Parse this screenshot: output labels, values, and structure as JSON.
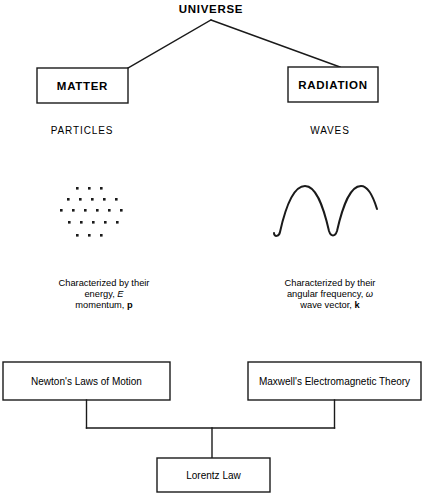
{
  "diagram": {
    "title": "UNIVERSE",
    "branches": [
      {
        "id": "matter",
        "box_label": "MATTER",
        "subtitle": "PARTICLES",
        "graphic": "particles-dot-cloud",
        "description": {
          "line1": "Characterized by their",
          "line2_prefix": "energy, ",
          "line2_symbol": "E",
          "line3_prefix": "momentum, ",
          "line3_symbol": "p"
        }
      },
      {
        "id": "radiation",
        "box_label": "RADIATION",
        "subtitle": "WAVES",
        "graphic": "sine-wave",
        "description": {
          "line1": "Characterized by their",
          "line2_prefix": "angular frequency, ",
          "line2_symbol": "ω",
          "line3_prefix": "wave vector, ",
          "line3_symbol": "k"
        }
      }
    ],
    "laws": [
      {
        "id": "newton",
        "label": "Newton's Laws of Motion"
      },
      {
        "id": "maxwell",
        "label": "Maxwell's Electromagnetic Theory"
      }
    ],
    "result": {
      "id": "lorentz",
      "label": "Lorentz Law"
    },
    "colors": {
      "background": "#ffffff",
      "ink": "#1a1a1a",
      "text": "#000000"
    }
  }
}
